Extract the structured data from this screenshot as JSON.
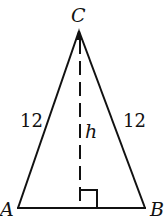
{
  "diagram": {
    "type": "isosceles-triangle",
    "vertices": [
      {
        "label": "A",
        "x": 18,
        "y": 208
      },
      {
        "label": "B",
        "x": 145,
        "y": 208
      },
      {
        "label": "C",
        "x": 79,
        "y": 30
      }
    ],
    "sides": {
      "AC_label": "12",
      "BC_label": "12"
    },
    "altitude": {
      "label": "h",
      "from": "C",
      "style": "dashed",
      "right_angle_marker": true
    },
    "colors": {
      "stroke": "#111111",
      "background": "#ffffff"
    }
  }
}
